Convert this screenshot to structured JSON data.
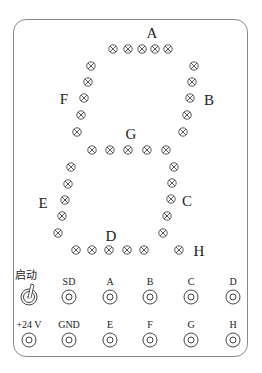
{
  "segment_labels": {
    "A": {
      "text": "A",
      "x": 152,
      "y": 33
    },
    "B": {
      "text": "B",
      "x": 209,
      "y": 100
    },
    "C": {
      "text": "C",
      "x": 187,
      "y": 201
    },
    "D": {
      "text": "D",
      "x": 111,
      "y": 236
    },
    "E": {
      "text": "E",
      "x": 43,
      "y": 203
    },
    "F": {
      "text": "F",
      "x": 64,
      "y": 99
    },
    "G": {
      "text": "G",
      "x": 131,
      "y": 134
    },
    "H": {
      "text": "H",
      "x": 199,
      "y": 251
    }
  },
  "lamps": {
    "A": [
      [
        113,
        49
      ],
      [
        128,
        49
      ],
      [
        142,
        49
      ],
      [
        155,
        49
      ],
      [
        168,
        49
      ]
    ],
    "B": [
      [
        194,
        66
      ],
      [
        192,
        82
      ],
      [
        190,
        98
      ],
      [
        187,
        115
      ],
      [
        183,
        132
      ]
    ],
    "F": [
      [
        91,
        66
      ],
      [
        88,
        82
      ],
      [
        84,
        98
      ],
      [
        81,
        115
      ],
      [
        77,
        132
      ]
    ],
    "G": [
      [
        92,
        150
      ],
      [
        110,
        150
      ],
      [
        128,
        150
      ],
      [
        147,
        150
      ],
      [
        166,
        150
      ]
    ],
    "C": [
      [
        174,
        167
      ],
      [
        172,
        183
      ],
      [
        171,
        199
      ],
      [
        167,
        216
      ],
      [
        163,
        233
      ]
    ],
    "E": [
      [
        71,
        167
      ],
      [
        68,
        184
      ],
      [
        65,
        200
      ],
      [
        62,
        216
      ],
      [
        58,
        233
      ]
    ],
    "D": [
      [
        76,
        250
      ],
      [
        92,
        250
      ],
      [
        109,
        250
      ],
      [
        127,
        250
      ],
      [
        144,
        250
      ]
    ],
    "H": [
      [
        179,
        250
      ]
    ]
  },
  "controls": {
    "start_switch": {
      "label": "启动",
      "x": 29,
      "y": 297,
      "label_y": 275
    }
  },
  "terminals_top": [
    {
      "label": "SD",
      "x": 69
    },
    {
      "label": "A",
      "x": 110
    },
    {
      "label": "B",
      "x": 150
    },
    {
      "label": "C",
      "x": 191
    },
    {
      "label": "D",
      "x": 233
    }
  ],
  "terminals_bottom": [
    {
      "label": "+24 V",
      "x": 29
    },
    {
      "label": "GND",
      "x": 69
    },
    {
      "label": "E",
      "x": 110
    },
    {
      "label": "F",
      "x": 150
    },
    {
      "label": "G",
      "x": 191
    },
    {
      "label": "H",
      "x": 233
    }
  ],
  "rows": {
    "top_label_y": 282,
    "top_circle_y": 297,
    "bottom_label_y": 325,
    "bottom_circle_y": 340
  },
  "colors": {
    "stroke": "#444444",
    "border": "#8a8a8a"
  }
}
